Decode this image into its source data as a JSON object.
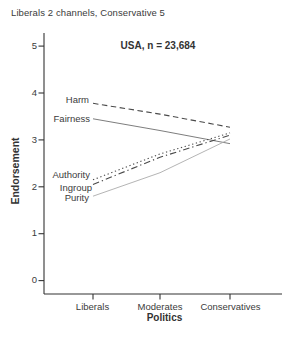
{
  "figure": {
    "title": "Liberals 2 channels, Conservative 5"
  },
  "chart_data": {
    "type": "line",
    "title": "USA, n = 23,684",
    "xlabel": "Politics",
    "ylabel": "Endorsement",
    "categories": [
      "Liberals",
      "Moderates",
      "Conservatives"
    ],
    "ylim": [
      0,
      5
    ],
    "yticks": [
      5,
      4,
      3,
      2,
      1,
      0
    ],
    "grid": false,
    "legend_position": "inline-labels-left",
    "axis_color": "#333333",
    "series": [
      {
        "name": "Harm",
        "values": [
          3.78,
          3.55,
          3.27
        ],
        "line": "dashed",
        "color": "#4a4a4a"
      },
      {
        "name": "Fairness",
        "values": [
          3.45,
          3.2,
          2.92
        ],
        "line": "solid",
        "color": "#6e6e6e"
      },
      {
        "name": "Authority",
        "values": [
          2.15,
          2.7,
          3.15
        ],
        "line": "dotted",
        "color": "#4a4a4a"
      },
      {
        "name": "Ingroup",
        "values": [
          2.05,
          2.63,
          3.1
        ],
        "line": "dashdot",
        "color": "#4a4a4a"
      },
      {
        "name": "Purity",
        "values": [
          1.8,
          2.3,
          3.02
        ],
        "line": "solid",
        "color": "#ababab"
      }
    ]
  }
}
